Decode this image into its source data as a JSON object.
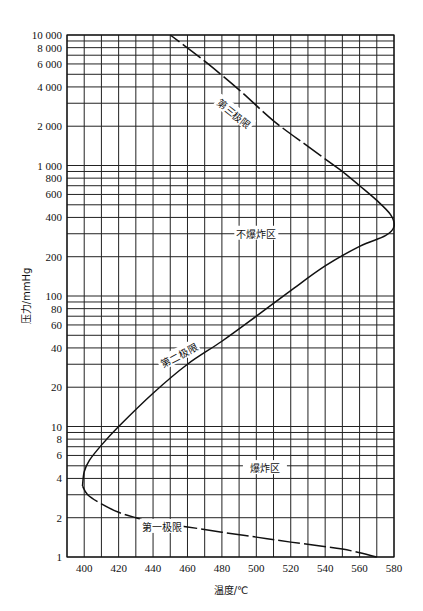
{
  "chart_data": {
    "type": "line",
    "title": "",
    "xlabel": "温度/℃",
    "ylabel": "压力/mmHg",
    "xlim": [
      390,
      580
    ],
    "ylim": [
      1,
      10000
    ],
    "yscale": "log",
    "grid": true,
    "x_ticks": [
      400,
      420,
      440,
      460,
      480,
      500,
      520,
      540,
      560,
      580
    ],
    "x_tick_labels": [
      "400",
      "420",
      "440",
      "460",
      "480",
      "500",
      "520",
      "540",
      "560",
      "580"
    ],
    "x_grid": [
      390,
      400,
      410,
      420,
      430,
      440,
      450,
      460,
      470,
      480,
      490,
      500,
      510,
      520,
      530,
      540,
      550,
      560,
      570,
      580
    ],
    "y_ticks": [
      1,
      2,
      4,
      6,
      8,
      10,
      20,
      40,
      60,
      80,
      100,
      200,
      400,
      600,
      800,
      1000,
      2000,
      4000,
      6000,
      8000,
      10000
    ],
    "y_tick_labels": [
      "1",
      "2",
      "4",
      "6",
      "8",
      "10",
      "20",
      "40",
      "60",
      "80",
      "100",
      "200",
      "400",
      "600",
      "800",
      "1 000",
      "2 000",
      "4 000",
      "6 000",
      "8 000",
      "10 000"
    ],
    "y_grid": [
      1,
      2,
      3,
      4,
      5,
      6,
      7,
      8,
      9,
      10,
      20,
      30,
      40,
      50,
      60,
      70,
      80,
      90,
      100,
      200,
      300,
      400,
      500,
      600,
      700,
      800,
      900,
      1000,
      2000,
      3000,
      4000,
      5000,
      6000,
      7000,
      8000,
      9000,
      10000
    ],
    "series": [
      {
        "name": "第一极限",
        "style": "dashed",
        "points": [
          [
            570,
            1
          ],
          [
            550,
            1.15
          ],
          [
            520,
            1.3
          ],
          [
            500,
            1.42
          ],
          [
            480,
            1.55
          ],
          [
            460,
            1.7
          ],
          [
            440,
            1.85
          ],
          [
            430,
            2.0
          ],
          [
            420,
            2.2
          ],
          [
            410,
            2.55
          ],
          [
            402,
            3.0
          ],
          [
            399,
            3.5
          ]
        ]
      },
      {
        "name": "第二极限",
        "style": "solid",
        "points": [
          [
            399,
            3.5
          ],
          [
            400,
            4.5
          ],
          [
            403,
            5.5
          ],
          [
            410,
            7.2
          ],
          [
            420,
            10
          ],
          [
            440,
            18
          ],
          [
            460,
            30
          ],
          [
            480,
            45
          ],
          [
            500,
            70
          ],
          [
            520,
            110
          ],
          [
            540,
            170
          ],
          [
            560,
            240
          ],
          [
            575,
            290
          ],
          [
            580,
            340
          ],
          [
            578,
            420
          ],
          [
            570,
            540
          ],
          [
            560,
            700
          ],
          [
            550,
            900
          ]
        ]
      },
      {
        "name": "第三极限",
        "style": "dashed",
        "points": [
          [
            550,
            900
          ],
          [
            530,
            1400
          ],
          [
            510,
            2200
          ],
          [
            490,
            3800
          ],
          [
            470,
            6300
          ],
          [
            450,
            10000
          ]
        ]
      }
    ],
    "annotations": [
      {
        "text": "第三极限",
        "x": 487,
        "y": 2500
      },
      {
        "text": "不爆炸区",
        "x": 500,
        "y": 300
      },
      {
        "text": "第二极限",
        "x": 455,
        "y": 35
      },
      {
        "text": "爆炸区",
        "x": 505,
        "y": 4.8
      },
      {
        "text": "第一极限",
        "x": 445,
        "y": 1.7
      }
    ]
  }
}
